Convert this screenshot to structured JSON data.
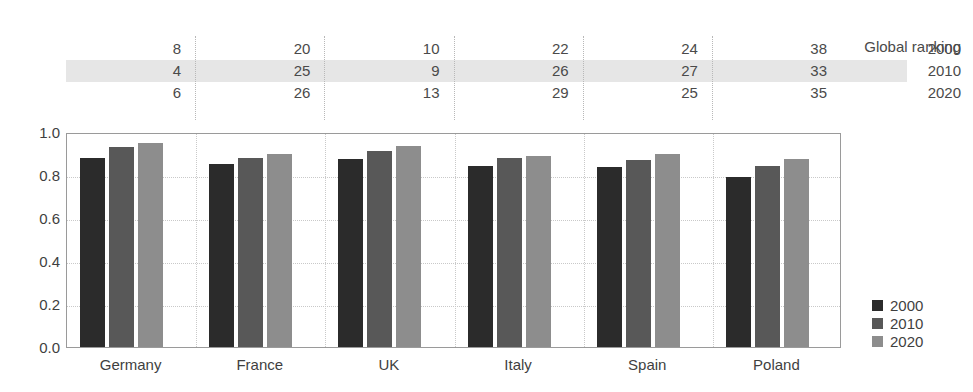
{
  "chart_data": {
    "type": "bar",
    "title": "",
    "subtitle": "",
    "xlabel": "",
    "ylabel": "",
    "ylim": [
      0.0,
      1.0
    ],
    "yticks": [
      "0.0",
      "0.2",
      "0.4",
      "0.6",
      "0.8",
      "1.0"
    ],
    "ytick_values": [
      0.0,
      0.2,
      0.4,
      0.6,
      0.8,
      1.0
    ],
    "grid": true,
    "legend_position": "right-bottom",
    "categories": [
      "Germany",
      "France",
      "UK",
      "Italy",
      "Spain",
      "Poland"
    ],
    "series": [
      {
        "name": "2000",
        "color": "#2b2b2b",
        "values": [
          0.88,
          0.85,
          0.875,
          0.84,
          0.835,
          0.79
        ]
      },
      {
        "name": "2010",
        "color": "#585858",
        "values": [
          0.93,
          0.88,
          0.91,
          0.88,
          0.87,
          0.84
        ]
      },
      {
        "name": "2020",
        "color": "#8d8d8d",
        "values": [
          0.95,
          0.9,
          0.935,
          0.89,
          0.9,
          0.875
        ]
      }
    ]
  },
  "ranking_table": {
    "title": "Global ranking",
    "row_labels": [
      "2000",
      "2010",
      "2020"
    ],
    "highlight_row_index": 1,
    "highlight_color": "#e6e6e6",
    "columns": [
      "Germany",
      "France",
      "UK",
      "Italy",
      "Spain",
      "Poland"
    ],
    "rows": [
      {
        "year": "2000",
        "values": [
          "8",
          "20",
          "10",
          "22",
          "24",
          "38"
        ]
      },
      {
        "year": "2010",
        "values": [
          "4",
          "25",
          "9",
          "26",
          "27",
          "33"
        ]
      },
      {
        "year": "2020",
        "values": [
          "6",
          "26",
          "13",
          "29",
          "25",
          "35"
        ]
      }
    ]
  },
  "legend": {
    "items": [
      {
        "label": "2000",
        "color": "#2b2b2b"
      },
      {
        "label": "2010",
        "color": "#585858"
      },
      {
        "label": "2020",
        "color": "#8d8d8d"
      }
    ]
  }
}
